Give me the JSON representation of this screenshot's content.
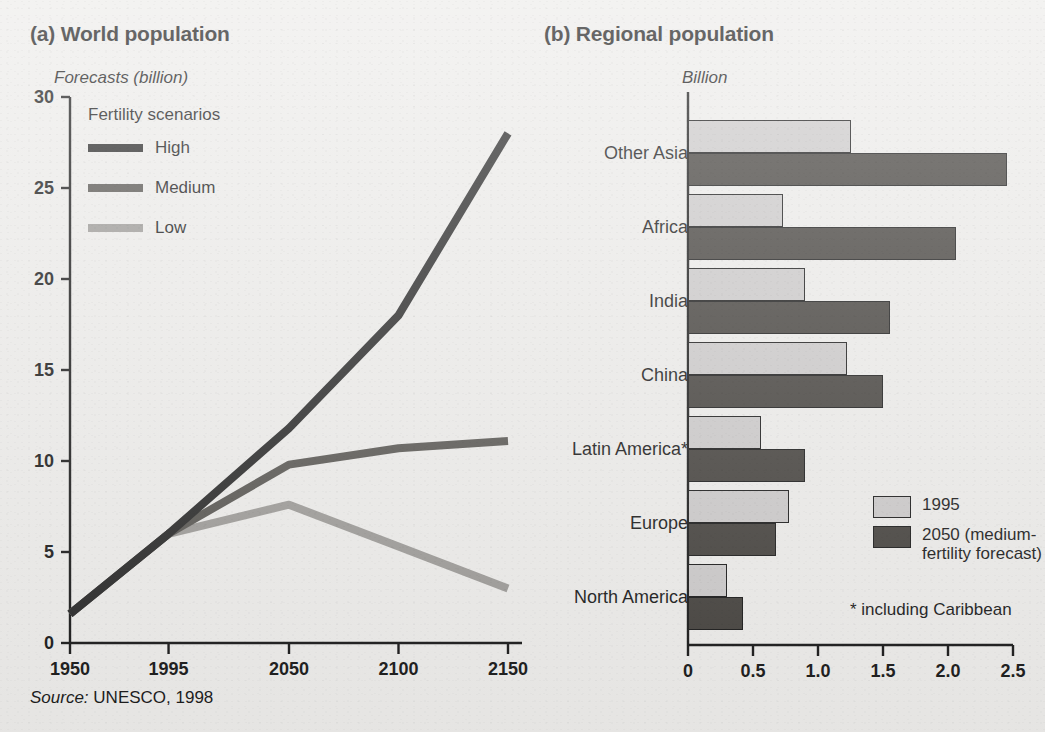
{
  "panels": {
    "a": {
      "title": "(a) World population",
      "unit_label": "Forecasts (billion)",
      "legend_title": "Fertility scenarios",
      "legend": [
        {
          "label": "High",
          "color": "#2a2a2a"
        },
        {
          "label": "Medium",
          "color": "#595753"
        },
        {
          "label": "Low",
          "color": "#9d9b98"
        }
      ]
    },
    "b": {
      "title": "(b) Regional population",
      "unit_label": "Billion",
      "legend": [
        {
          "label": "1995",
          "color": "#cccaca"
        },
        {
          "label": "2050 (medium-fertility forecast)",
          "color": "#46433f"
        }
      ],
      "footnote": "* including Caribbean"
    }
  },
  "source": {
    "prefix": "Source:",
    "text": "UNESCO, 1998"
  },
  "chart_data": [
    {
      "type": "line",
      "panel": "a",
      "title": "(a) World population",
      "ylabel": "Forecasts (billion)",
      "xlabel": "",
      "x": [
        1950,
        1995,
        2050,
        2100,
        2150
      ],
      "xtick_labels": [
        "1950",
        "1995",
        "2050",
        "2100",
        "2150"
      ],
      "ytick_labels": [
        "0",
        "5",
        "10",
        "15",
        "20",
        "25",
        "30"
      ],
      "yticks": [
        0,
        5,
        10,
        15,
        20,
        25,
        30
      ],
      "ylim": [
        0,
        30
      ],
      "grid": false,
      "legend_title": "Fertility scenarios",
      "legend_position": "upper-left-inside",
      "series": [
        {
          "name": "High",
          "color": "#2a2a2a",
          "values": [
            1.6,
            6.0,
            11.8,
            18.0,
            28.0
          ]
        },
        {
          "name": "Medium",
          "color": "#595753",
          "values": [
            1.6,
            6.0,
            9.8,
            10.7,
            11.1
          ]
        },
        {
          "name": "Low",
          "color": "#9d9b98",
          "values": [
            1.6,
            6.0,
            7.6,
            5.3,
            3.0
          ]
        }
      ]
    },
    {
      "type": "bar",
      "orientation": "horizontal",
      "panel": "b",
      "title": "(b) Regional population",
      "xlabel": "Billion",
      "ylabel": "",
      "categories": [
        "Other Asia",
        "Africa",
        "India",
        "China",
        "Latin America*",
        "Europe",
        "North America"
      ],
      "xtick_labels": [
        "0",
        "0.5",
        "1.0",
        "1.5",
        "2.0",
        "2.5"
      ],
      "xticks": [
        0,
        0.5,
        1.0,
        1.5,
        2.0,
        2.5
      ],
      "xlim": [
        0,
        2.5
      ],
      "grid": false,
      "legend_position": "lower-right-inside",
      "footnote": "* including Caribbean",
      "series": [
        {
          "name": "1995",
          "color": "#cccaca",
          "values": [
            1.25,
            0.73,
            0.9,
            1.22,
            0.56,
            0.78,
            0.3
          ]
        },
        {
          "name": "2050 (medium-fertility forecast)",
          "color": "#46433f",
          "values": [
            2.45,
            2.06,
            1.55,
            1.5,
            0.9,
            0.68,
            0.42
          ]
        }
      ]
    }
  ]
}
